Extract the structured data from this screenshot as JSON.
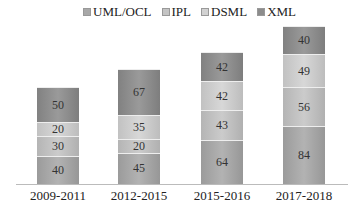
{
  "chart_data": {
    "type": "bar",
    "stacked": true,
    "title": "",
    "xlabel": "",
    "ylabel": "",
    "categories": [
      "2009-2011",
      "2012-2015",
      "2015-2016",
      "2017-2018"
    ],
    "series": [
      {
        "name": "UML/OCL",
        "values": [
          40,
          45,
          64,
          84
        ],
        "color": "#a8a8a8"
      },
      {
        "name": "IPL",
        "values": [
          30,
          20,
          43,
          56
        ],
        "color": "#c4c4c4"
      },
      {
        "name": "DSML",
        "values": [
          20,
          35,
          42,
          49
        ],
        "color": "#d2d2d2"
      },
      {
        "name": "XML",
        "values": [
          50,
          67,
          42,
          40
        ],
        "color": "#8c8c8c"
      }
    ],
    "legend_position": "top",
    "grid": false
  }
}
